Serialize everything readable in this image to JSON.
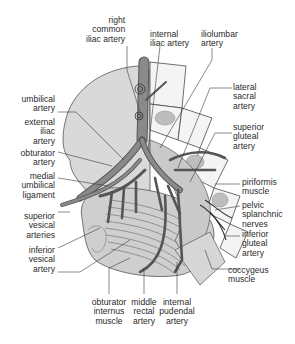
{
  "colors": {
    "artery": "#7d7d7d",
    "artery_dark": "#5a5a5a",
    "bladder_fill": "#d2d2d2",
    "muscle_fill": "#c4c4c4",
    "bone_outline": "#4a4a4a",
    "leader_line": "#3a3a3a",
    "label_text": "#2a2a2a"
  },
  "labels": {
    "right_common_iliac": "right\ncommon\niliac artery",
    "internal_iliac": "internal\niliac artery",
    "iliolumbar": "iliolumbar\nartery",
    "lateral_sacral": "lateral\nsacral\nartery",
    "superior_gluteal": "superior\ngluteal\nartery",
    "umbilical": "umbilical\nartery",
    "external_iliac": "external\niliac\nartery",
    "obturator_artery": "obturator\nartery",
    "medial_umbilical_ligament": "medial\numbilical\nligament",
    "superior_vesical": "superior\nvesical\narteries",
    "inferior_vesical": "inferior\nvesical\nartery",
    "piriformis": "piriformis\nmuscle",
    "pelvic_splanchnic": "pelvic\nsplanchnic\nnerves",
    "inferior_gluteal": "inferior\ngluteal\nartery",
    "coccygeus": "coccygeus\nmuscle",
    "obturator_internus": "obturator\ninternus\nmuscle",
    "middle_rectal": "middle\nrectal\nartery",
    "internal_pudendal": "internal\npudendal\nartery"
  }
}
